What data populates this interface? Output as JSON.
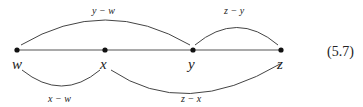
{
  "diagram": {
    "points": [
      {
        "id": "w",
        "label": "w",
        "x": 17
      },
      {
        "id": "x",
        "label": "x",
        "x": 105
      },
      {
        "id": "y",
        "label": "y",
        "x": 193
      },
      {
        "id": "z",
        "label": "z",
        "x": 281
      }
    ],
    "arcs": [
      {
        "from": "w",
        "to": "y",
        "side": "above",
        "label": "y − w"
      },
      {
        "from": "y",
        "to": "z",
        "side": "above",
        "label": "z − y"
      },
      {
        "from": "w",
        "to": "x",
        "side": "below",
        "label": "x − w"
      },
      {
        "from": "x",
        "to": "z",
        "side": "below",
        "label": "z − x"
      }
    ],
    "equation_number": "(5.7)",
    "colors": {
      "line": "#333333",
      "dot": "#111111",
      "text": "#222222"
    }
  }
}
